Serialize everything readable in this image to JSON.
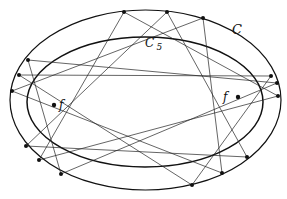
{
  "diagram": {
    "title": "",
    "labels": {
      "outer_curve": "C",
      "inner_curve_main": "C",
      "inner_curve_sup": "′",
      "inner_curve_sub": "5",
      "focus_left": "f",
      "focus_right": "f"
    },
    "outer_ellipse": {
      "cx": 145.5,
      "cy": 100,
      "rx": 135.5,
      "ry": 90
    },
    "inner_ellipse": {
      "cx": 145,
      "cy": 102,
      "rx": 118,
      "ry": 65
    },
    "foci": [
      {
        "x": 54,
        "y": 105
      },
      {
        "x": 238,
        "y": 97
      }
    ],
    "points": [
      {
        "x": 124,
        "y": 12
      },
      {
        "x": 167,
        "y": 12
      },
      {
        "x": 203,
        "y": 18
      },
      {
        "x": 271,
        "y": 76
      },
      {
        "x": 277,
        "y": 83
      },
      {
        "x": 278,
        "y": 96
      },
      {
        "x": 247,
        "y": 157
      },
      {
        "x": 222,
        "y": 173
      },
      {
        "x": 192,
        "y": 185
      },
      {
        "x": 61,
        "y": 174
      },
      {
        "x": 39,
        "y": 160
      },
      {
        "x": 26,
        "y": 146
      },
      {
        "x": 12,
        "y": 91
      },
      {
        "x": 19,
        "y": 75
      },
      {
        "x": 28,
        "y": 60
      }
    ],
    "chord_step": 5,
    "colors": {
      "stroke": "#111111",
      "background": "#ffffff"
    }
  }
}
